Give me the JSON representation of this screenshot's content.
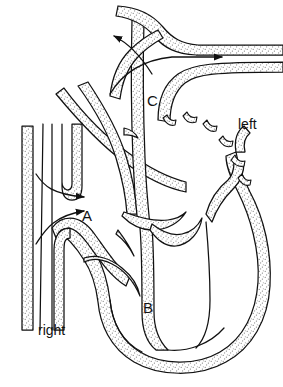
{
  "figure": {
    "kind": "anatomical-line-diagram",
    "width": 283,
    "height": 387,
    "background_color": "#ffffff",
    "line_color": "#111111",
    "stipple_color": "#8a8a8a",
    "stipple_fill_color": "#ffffff"
  },
  "labels": {
    "chamber_a": "A",
    "chamber_b": "B",
    "chamber_c": "C",
    "side_right": "right",
    "side_left": "left"
  },
  "annotations": {
    "arrows": [
      {
        "name": "arrow-inflow-upper",
        "direction": "right",
        "x": 35,
        "y": 198
      },
      {
        "name": "arrow-inflow-lower",
        "direction": "right",
        "x": 35,
        "y": 212
      },
      {
        "name": "arrow-outflow-left",
        "direction": "left",
        "x": 140,
        "y": 36
      },
      {
        "name": "arrow-outflow-right",
        "direction": "right",
        "x": 175,
        "y": 57
      }
    ],
    "broken_vessel_segments": 6
  }
}
